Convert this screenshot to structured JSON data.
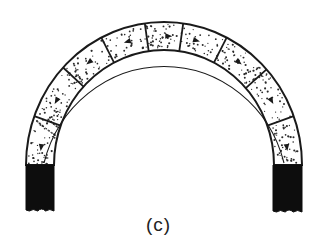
{
  "figure": {
    "caption": "(c)"
  },
  "diagram": {
    "center_x": 164,
    "spring_y": 165,
    "outer": {
      "rx": 138,
      "ry": 143
    },
    "inner": {
      "rx": 110,
      "ry": 115
    },
    "voussoir_joint_angles_deg": [
      20,
      43,
      63,
      82,
      98,
      117,
      138,
      160
    ],
    "thrust_line": {
      "rx": 124,
      "ry": 129,
      "arrow_angles_deg": [
        8,
        30,
        53,
        73,
        92,
        105,
        127,
        150,
        172
      ]
    },
    "piers": [
      {
        "name": "left-pier",
        "x": 26,
        "y": 165,
        "width": 28,
        "height": 46
      },
      {
        "name": "right-pier",
        "x": 273,
        "y": 165,
        "width": 29,
        "height": 47
      }
    ],
    "colors": {
      "stroke": "#1a1a1a",
      "fill": "#ffffff",
      "stipple": "#2a2a2a",
      "pier": "#0d0d0d"
    }
  }
}
